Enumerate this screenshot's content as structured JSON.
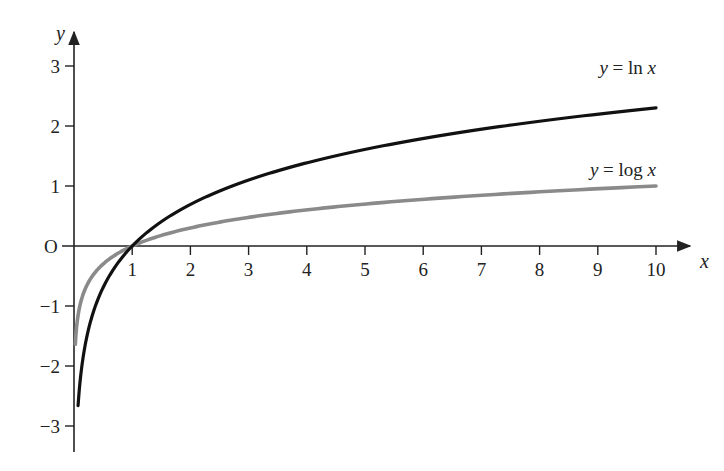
{
  "chart_data": {
    "type": "line",
    "title": "",
    "xlabel": "x",
    "ylabel": "y",
    "origin_label": "O",
    "xlim": [
      0,
      10.5
    ],
    "ylim": [
      -3.4,
      3.4
    ],
    "x_ticks": [
      1,
      2,
      3,
      4,
      5,
      6,
      7,
      8,
      9,
      10
    ],
    "y_ticks": [
      3,
      2,
      1,
      -1,
      -2,
      -3
    ],
    "y_tick_labels": [
      "3",
      "2",
      "1",
      "−1",
      "−2",
      "−3"
    ],
    "grid": false,
    "legend": "inline labels at right end of curves",
    "series": [
      {
        "name": "y = ln x",
        "label_parts": {
          "y": "y",
          "eq": " = ln ",
          "x": "x"
        },
        "color": "#111111",
        "x_range": [
          0.07,
          10
        ],
        "x": [
          0.07,
          0.1,
          0.2,
          0.5,
          1,
          2,
          3,
          4,
          5,
          6,
          7,
          8,
          9,
          10
        ],
        "values": [
          -2.66,
          -2.3,
          -1.61,
          -0.69,
          0,
          0.69,
          1.1,
          1.39,
          1.61,
          1.79,
          1.95,
          2.08,
          2.2,
          2.3
        ]
      },
      {
        "name": "y = log x",
        "label_parts": {
          "y": "y",
          "eq": " = log ",
          "x": "x"
        },
        "color": "#8a8a8a",
        "x_range": [
          0.023,
          10
        ],
        "x": [
          0.023,
          0.05,
          0.1,
          0.2,
          0.5,
          1,
          2,
          3,
          4,
          5,
          6,
          7,
          8,
          9,
          10
        ],
        "values": [
          -1.64,
          -1.3,
          -1.0,
          -0.7,
          -0.3,
          0,
          0.3,
          0.48,
          0.6,
          0.7,
          0.78,
          0.85,
          0.9,
          0.95,
          1.0
        ]
      }
    ],
    "colors": {
      "axis": "#222222",
      "ln": "#111111",
      "log": "#8a8a8a"
    }
  }
}
